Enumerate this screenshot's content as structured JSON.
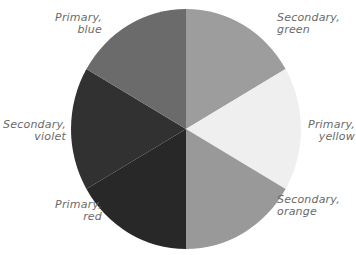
{
  "chart_data": {
    "type": "pie",
    "title": "",
    "center": [
      186,
      129
    ],
    "radius_x": 115,
    "radius_y": 120,
    "slices": [
      {
        "label": "Secondary, green",
        "line1": "Secondary,",
        "line2": "green",
        "value": 1,
        "color": "#9d9d9d",
        "start": 0,
        "end": 60
      },
      {
        "label": "Primary, yellow",
        "line1": "Primary,",
        "line2": "yellow",
        "value": 1,
        "color": "#efefef",
        "start": 60,
        "end": 120
      },
      {
        "label": "Secondary, orange",
        "line1": "Secondary,",
        "line2": "orange",
        "value": 1,
        "color": "#999999",
        "start": 120,
        "end": 180
      },
      {
        "label": "Primary, red",
        "line1": "Primary,",
        "line2": "red",
        "value": 1,
        "color": "#282828",
        "start": 180,
        "end": 240
      },
      {
        "label": "Secondary, violet",
        "line1": "Secondary,",
        "line2": "violet",
        "value": 1,
        "color": "#313131",
        "start": 240,
        "end": 300
      },
      {
        "label": "Primary, blue",
        "line1": "Primary,",
        "line2": "blue",
        "value": 1,
        "color": "#6b6b6b",
        "start": 300,
        "end": 360
      }
    ],
    "categories": [
      "Secondary, green",
      "Primary, yellow",
      "Secondary, orange",
      "Primary, red",
      "Secondary, violet",
      "Primary, blue"
    ],
    "values": [
      1,
      1,
      1,
      1,
      1,
      1
    ],
    "legend": "none (direct labels)"
  },
  "labels": {
    "blue": {
      "line1": "Primary,",
      "line2": "blue"
    },
    "green": {
      "line1": "Secondary,",
      "line2": "green"
    },
    "violet": {
      "line1": "Secondary,",
      "line2": "violet"
    },
    "yellow": {
      "line1": "Primary,",
      "line2": "yellow"
    },
    "red": {
      "line1": "Primary,",
      "line2": "red"
    },
    "orange": {
      "line1": "Secondary,",
      "line2": "orange"
    }
  }
}
